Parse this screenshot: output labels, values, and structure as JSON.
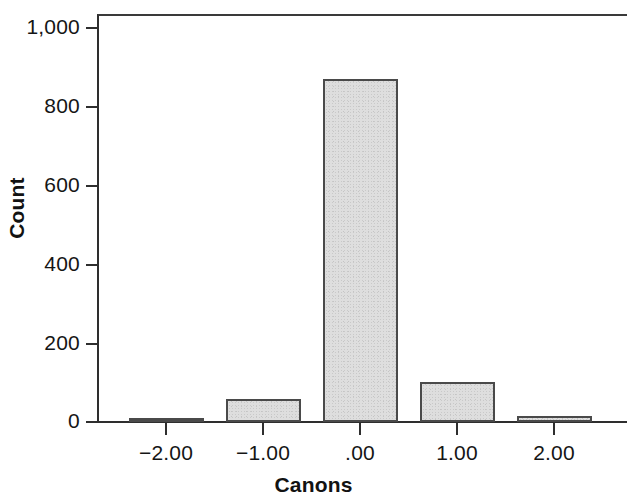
{
  "chart_data": {
    "type": "bar",
    "title": "",
    "xlabel": "Canons",
    "ylabel": "Count",
    "categories": [
      "−2.00",
      "−1.00",
      ".00",
      "1.00",
      "2.00"
    ],
    "values": [
      10,
      58,
      868,
      100,
      14
    ],
    "ylim": [
      0,
      1040
    ],
    "xlim": [
      -2.6,
      2.6
    ],
    "yticks": [
      0,
      200,
      400,
      600,
      800,
      1000
    ],
    "ytick_labels": [
      "0",
      "200",
      "400",
      "600",
      "800",
      "1,000"
    ],
    "xtick_labels": [
      "−2.00",
      "−1.00",
      ".00",
      "1.00",
      "2.00"
    ],
    "grid": false,
    "legend": null,
    "bar_fill_color": "#dedede",
    "bar_edge_color": "#4a4a4a",
    "axis_color": "#2e2e2e",
    "text_color": "#151515"
  }
}
